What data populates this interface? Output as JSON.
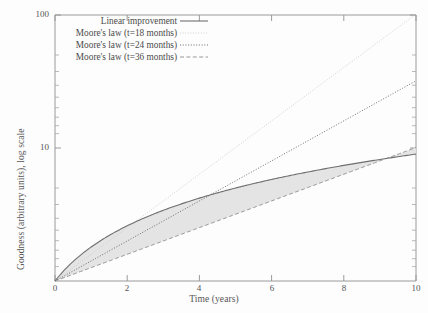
{
  "chart_data": {
    "type": "line",
    "title": "",
    "xlabel": "Time (years)",
    "ylabel": "Goodness (arbitrary units), log scale",
    "xlim": [
      0,
      10
    ],
    "ylim": [
      1,
      100
    ],
    "yscale": "log",
    "xscale": "linear",
    "grid": false,
    "xticks": [
      "0",
      "2",
      "4",
      "6",
      "8",
      "10"
    ],
    "xtick_values": [
      0,
      2,
      4,
      6,
      8,
      10
    ],
    "yticks": [
      "10",
      "100"
    ],
    "ytick_values": [
      10,
      100
    ],
    "legend_position": "upper left",
    "series": [
      {
        "name": "Linear improvement",
        "style": "solid",
        "color": "#6f6f6f",
        "x": [
          0,
          1,
          2,
          3,
          4,
          5,
          6,
          7,
          8,
          9,
          10
        ],
        "values": [
          1.0,
          1.8,
          2.6,
          3.4,
          4.2,
          5.0,
          5.8,
          6.6,
          7.4,
          8.2,
          9.0
        ]
      },
      {
        "name": "Moore's law (t=18 months)",
        "style": "fine-dotted",
        "color": "#c9c9c9",
        "doubling_months": 18,
        "x": [
          0,
          1,
          2,
          3,
          4,
          5,
          6,
          7,
          8,
          9,
          10
        ],
        "values": [
          1.0,
          1.59,
          2.52,
          4.0,
          6.35,
          10.08,
          16.0,
          25.4,
          40.3,
          64.0,
          101.6
        ]
      },
      {
        "name": "Moore's law (t=24 months)",
        "style": "dotted",
        "color": "#575757",
        "doubling_months": 24,
        "x": [
          0,
          1,
          2,
          3,
          4,
          5,
          6,
          7,
          8,
          9,
          10
        ],
        "values": [
          1.0,
          1.41,
          2.0,
          2.83,
          4.0,
          5.66,
          8.0,
          11.31,
          16.0,
          22.63,
          32.0
        ]
      },
      {
        "name": "Moore's law (t=36 months)",
        "style": "dashed",
        "color": "#8a8a8a",
        "doubling_months": 36,
        "x": [
          0,
          1,
          2,
          3,
          4,
          5,
          6,
          7,
          8,
          9,
          10
        ],
        "values": [
          1.0,
          1.26,
          1.59,
          2.0,
          2.52,
          3.17,
          4.0,
          5.04,
          6.35,
          8.0,
          10.08
        ]
      }
    ],
    "shaded_region": {
      "label": "region between linear improvement and Moore's law (t=36 months)",
      "upper_series": "Linear improvement",
      "lower_series": "Moore's law (t=36 months)",
      "fill_color": "#e3e3e3"
    }
  },
  "legend": {
    "items": [
      {
        "label": "Linear improvement",
        "style": "solid"
      },
      {
        "label": "Moore's law (t=18 months)",
        "style": "fine-dotted"
      },
      {
        "label": "Moore's law (t=24 months)",
        "style": "dotted"
      },
      {
        "label": "Moore's law (t=36 months)",
        "style": "dashed"
      }
    ]
  },
  "axes": {
    "x_title": "Time (years)",
    "y_title": "Goodness (arbitrary units), log scale",
    "x_ticks": [
      {
        "label": "0"
      },
      {
        "label": "2"
      },
      {
        "label": "4"
      },
      {
        "label": "6"
      },
      {
        "label": "8"
      },
      {
        "label": "10"
      }
    ],
    "y_ticks": [
      {
        "label": "100"
      },
      {
        "label": "10"
      }
    ]
  },
  "colors": {
    "background": "#fdfdfd",
    "axis": "#8f8f8f",
    "text": "#4a4a4a",
    "fill": "#e3e3e3"
  }
}
